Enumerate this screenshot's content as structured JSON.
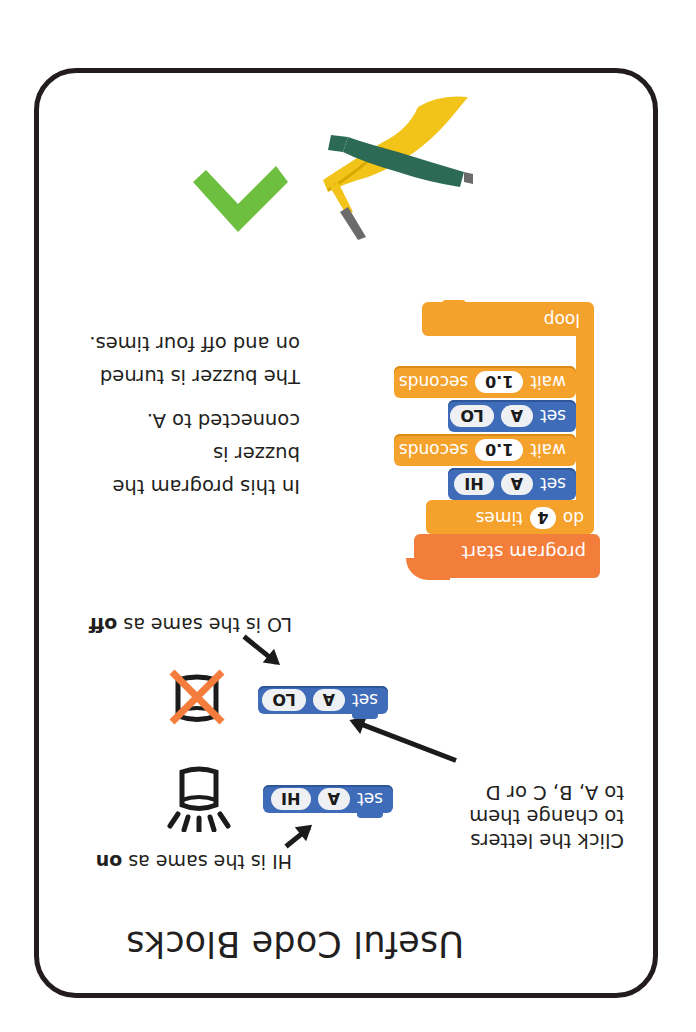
{
  "orientation": "rotated-180",
  "card": {
    "title": "Useful Code Blocks",
    "border_color": "#221c1c"
  },
  "examples": {
    "hi_note": {
      "prefix": "HI is the same as ",
      "emphasis": "on"
    },
    "lo_note": {
      "prefix": "LO is the same as ",
      "emphasis": "off"
    },
    "click_instructions": [
      "Click the letters",
      "to change them",
      "to A, B, C or D"
    ],
    "set_hi_block": {
      "keyword": "set",
      "pin": "A",
      "state": "HI"
    },
    "set_lo_block": {
      "keyword": "set",
      "pin": "A",
      "state": "LO"
    },
    "icons": [
      "buzzer-on-icon",
      "buzzer-off-icon"
    ]
  },
  "program": {
    "hat": "program start",
    "repeat": {
      "prefix": "do",
      "count": "4",
      "suffix": "times"
    },
    "steps": [
      {
        "type": "set",
        "keyword": "set",
        "pin": "A",
        "state": "HI"
      },
      {
        "type": "wait",
        "keyword": "wait",
        "value": "1.0",
        "unit": "seconds"
      },
      {
        "type": "set",
        "keyword": "set",
        "pin": "A",
        "state": "LO"
      },
      {
        "type": "wait",
        "keyword": "wait",
        "value": "1.0",
        "unit": "seconds"
      }
    ],
    "footer": "loop",
    "description": [
      "In this program the",
      "buzzer is",
      "connected to A.",
      "The buzzer is turned",
      "on and off four times."
    ]
  },
  "colors": {
    "set_block": "#3f6cb8",
    "control_block": "#f5a22c",
    "hat_block": "#f37d3b",
    "off_cross": "#f47c3c",
    "check_mark": "#6cbf3f",
    "clip_green": "#2d6a55",
    "clip_yellow": "#f2c318"
  }
}
